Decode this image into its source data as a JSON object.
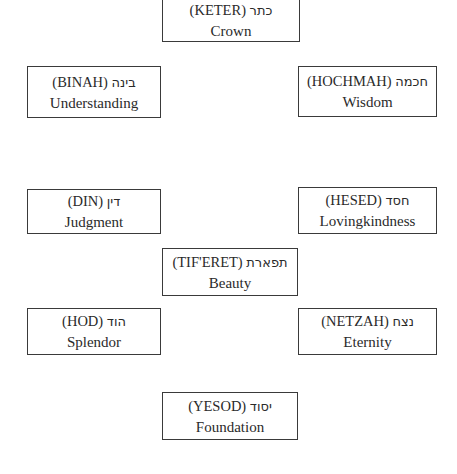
{
  "diagram": {
    "type": "sefirot-tree",
    "nodes": [
      {
        "id": "keter",
        "transliteration": "(KETER)",
        "hebrew": "כתר",
        "english": "Crown"
      },
      {
        "id": "binah",
        "transliteration": "(BINAH)",
        "hebrew": "בינה",
        "english": "Understanding"
      },
      {
        "id": "hochmah",
        "transliteration": "(HOCHMAH)",
        "hebrew": "חכמה",
        "english": "Wisdom"
      },
      {
        "id": "din",
        "transliteration": "(DIN)",
        "hebrew": "דין",
        "english": "Judgment"
      },
      {
        "id": "hesed",
        "transliteration": "(HESED)",
        "hebrew": "חסד",
        "english": "Lovingkindness"
      },
      {
        "id": "tiferet",
        "transliteration": "(TIF'ERET)",
        "hebrew": "תפארת",
        "english": "Beauty"
      },
      {
        "id": "hod",
        "transliteration": "(HOD)",
        "hebrew": "הוד",
        "english": "Splendor"
      },
      {
        "id": "netzah",
        "transliteration": "(NETZAH)",
        "hebrew": "נצח",
        "english": "Eternity"
      },
      {
        "id": "yesod",
        "transliteration": "(YESOD)",
        "hebrew": "יסוד",
        "english": "Foundation"
      }
    ],
    "colors": {
      "border": "#3a3a3a",
      "text": "#2a2a2a",
      "background": "#ffffff"
    }
  }
}
